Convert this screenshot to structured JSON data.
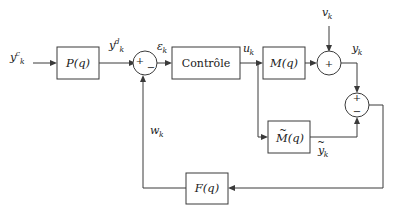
{
  "diagram": {
    "blocks": [
      {
        "id": "prefilter",
        "label": "P(q)",
        "name": "block-p-q"
      },
      {
        "id": "controller",
        "label": "Contrôle",
        "name": "block-controle"
      },
      {
        "id": "plant",
        "label": "M(q)",
        "name": "block-m-q"
      },
      {
        "id": "model",
        "label": "M(q)",
        "name": "block-m-tilde-q"
      },
      {
        "id": "feedback",
        "label": "F(q)",
        "name": "block-f-q"
      }
    ],
    "summers": [
      {
        "id": "error-sum",
        "signs": [
          "+",
          "−"
        ],
        "name": "summing-junction-error"
      },
      {
        "id": "output-sum",
        "signs": [
          "+"
        ],
        "name": "summing-junction-output"
      },
      {
        "id": "comparison-sum",
        "signs": [
          "+",
          "−"
        ],
        "name": "summing-junction-comparison"
      }
    ],
    "signals": {
      "reference": {
        "base": "y",
        "sup": "c",
        "sub": "k"
      },
      "desired": {
        "base": "y",
        "sup": "d",
        "sub": "k"
      },
      "error": {
        "base": "ε",
        "sub": "k"
      },
      "control": {
        "base": "u",
        "sub": "k"
      },
      "disturbance": {
        "base": "v",
        "sub": "k"
      },
      "output": {
        "base": "y",
        "sub": "k"
      },
      "model_out": {
        "base": "y",
        "sub": "k",
        "tilde": true
      },
      "feedback": {
        "base": "w",
        "sub": "k"
      }
    },
    "colors": {
      "line": "#3a3a3a",
      "background": "#ffffff",
      "text": "#1a1a1a"
    }
  }
}
